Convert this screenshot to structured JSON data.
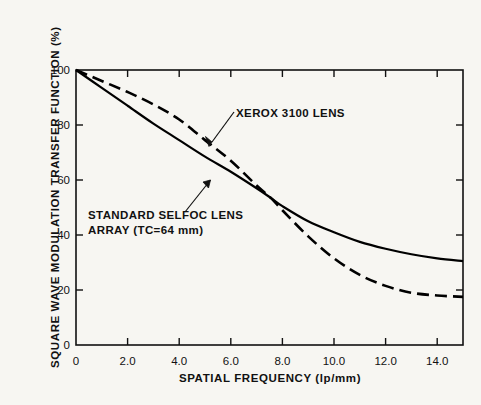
{
  "chart_data": {
    "type": "line",
    "title": "",
    "xlabel": "SPATIAL FREQUENCY (lp/mm)",
    "ylabel": "SQUARE WAVE MODULATION TRANSFER FUNCTION (%)",
    "xlim": [
      0,
      15
    ],
    "ylim": [
      0,
      100
    ],
    "grid": false,
    "legend_position": "inline-annotations",
    "xticks": [
      0,
      2.0,
      4.0,
      6.0,
      8.0,
      10.0,
      12.0,
      14.0
    ],
    "xtick_labels": [
      "0",
      "2.0",
      "4.0",
      "6.0",
      "8.0",
      "10.0",
      "12.0",
      "14.0"
    ],
    "yticks": [
      0,
      20,
      40,
      60,
      80,
      100
    ],
    "ytick_labels": [
      "0",
      "20",
      "40",
      "60",
      "80",
      "100"
    ],
    "series": [
      {
        "name": "STANDARD SELFOC LENS ARRAY (TC=64 mm)",
        "style": "solid",
        "color": "#000000",
        "x": [
          0,
          1.0,
          2.0,
          3.0,
          4.0,
          5.0,
          6.0,
          7.0,
          7.55,
          8.0,
          9.0,
          10.0,
          11.0,
          12.0,
          13.0,
          14.0,
          15.0
        ],
        "values": [
          100,
          93.5,
          87.0,
          80.5,
          74.5,
          68.5,
          63.0,
          57.0,
          53.5,
          50.5,
          45.0,
          41.0,
          37.5,
          35.0,
          33.0,
          31.5,
          30.5
        ]
      },
      {
        "name": "XEROX 3100 LENS",
        "style": "dashed",
        "color": "#000000",
        "x": [
          0,
          1.0,
          2.0,
          3.0,
          4.0,
          5.0,
          6.0,
          7.0,
          7.55,
          8.0,
          9.0,
          10.0,
          11.0,
          12.0,
          13.0,
          14.0,
          15.0
        ],
        "values": [
          100,
          96.0,
          92.0,
          87.5,
          82.0,
          74.5,
          67.0,
          58.0,
          53.5,
          49.0,
          39.5,
          31.5,
          25.5,
          21.5,
          19.0,
          18.0,
          17.5
        ]
      }
    ],
    "annotations": [
      {
        "name": "XEROX 3100 LENS",
        "text": "XEROX 3100 LENS",
        "points_to_series": "XEROX 3100 LENS"
      },
      {
        "name": "STANDARD SELFOC LENS ARRAY",
        "line1": "STANDARD SELFOC LENS",
        "line2": "ARRAY  (TC=64 mm)",
        "points_to_series": "STANDARD SELFOC LENS ARRAY (TC=64 mm)"
      }
    ]
  },
  "figure": {
    "background_color": "#f7f6f2",
    "axis_color": "#111111"
  }
}
